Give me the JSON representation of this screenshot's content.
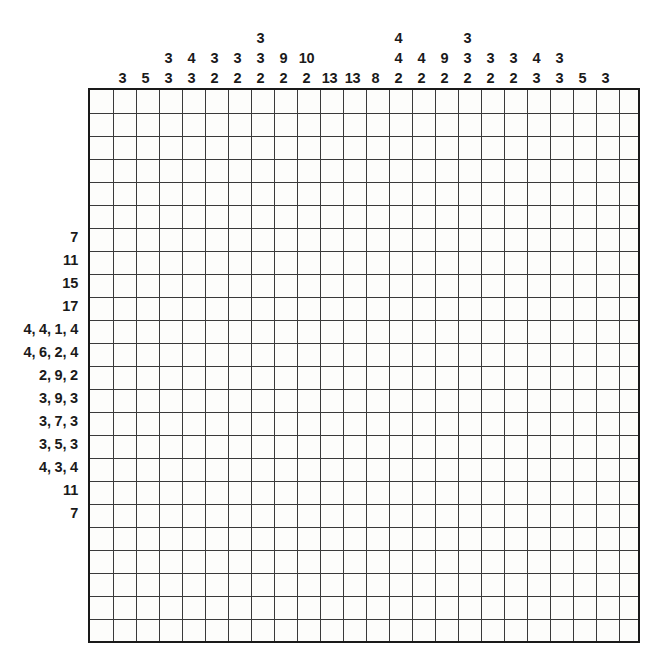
{
  "puzzle": {
    "type": "nonogram",
    "columns": 24,
    "rows": 24,
    "cell_size": 23,
    "grid_color": "#3a3a3a",
    "border_color": "#1a1a1a",
    "background_color": "#ffffff",
    "cell_color": "#fdfdfb"
  },
  "column_clues": [
    [],
    [
      "3"
    ],
    [
      "5"
    ],
    [
      "3",
      "3"
    ],
    [
      "4",
      "3"
    ],
    [
      "3",
      "2"
    ],
    [
      "3",
      "2"
    ],
    [
      "3",
      "3",
      "2"
    ],
    [
      "9",
      "2"
    ],
    [
      "10",
      "2"
    ],
    [
      "13"
    ],
    [
      "13"
    ],
    [
      "8"
    ],
    [
      "4",
      "4",
      "2"
    ],
    [
      "4",
      "2"
    ],
    [
      "9",
      "2"
    ],
    [
      "3",
      "3",
      "2"
    ],
    [
      "3",
      "2"
    ],
    [
      "3",
      "2"
    ],
    [
      "4",
      "3"
    ],
    [
      "3",
      "3"
    ],
    [
      "5"
    ],
    [
      "3"
    ],
    []
  ],
  "row_clues": [
    "",
    "",
    "",
    "",
    "",
    "",
    "7",
    "11",
    "15",
    "17",
    "4, 4, 1, 4",
    "4, 6, 2, 4",
    "2, 9, 2",
    "3, 9, 3",
    "3, 7, 3",
    "3, 5, 3",
    "4, 3, 4",
    "11",
    "7",
    "",
    "",
    "",
    "",
    ""
  ]
}
